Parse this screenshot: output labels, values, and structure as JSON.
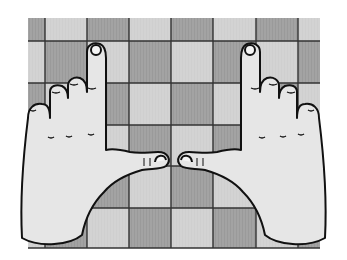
{
  "image": {
    "subject": "Two hands resting on a checkered board",
    "board": {
      "columns": 7,
      "rows": 6,
      "colors": {
        "dark": "#9a9a9a",
        "light": "#cfcfcf",
        "lines": "#333333"
      }
    },
    "hands": {
      "count": 2,
      "skin_color": "#e6e6e6",
      "outline_color": "#111111"
    }
  }
}
